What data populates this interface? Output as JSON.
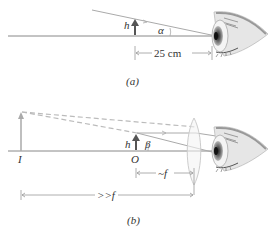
{
  "panel_a": {
    "caption": "(a)",
    "object_label": "h",
    "angle_label": "α",
    "distance_label": "25 cm"
  },
  "panel_b": {
    "caption": "(b)",
    "object_label": "h",
    "angle_label": "β",
    "image_point_label": "I",
    "object_point_label": "O",
    "focal_distance_label": "~f",
    "image_distance_label": ">>f"
  },
  "colors": {
    "axis_line": "#888888",
    "ray_line": "#aaaaaa",
    "object_arrow": "#555555",
    "image_arrow": "#aaaaaa",
    "dashed_ray": "#bbbbbb",
    "lens": "#cccccc",
    "eye_skin": "#e0e0e0"
  }
}
